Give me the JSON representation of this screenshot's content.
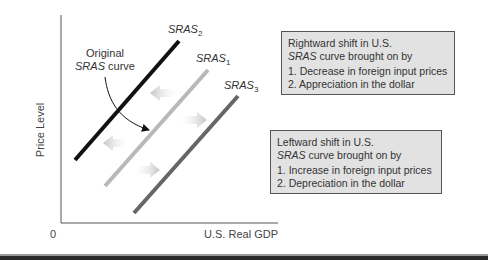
{
  "diagram": {
    "y_axis_label": "Price Level",
    "x_axis_label": "U.S. Real GDP",
    "origin_label": "0",
    "curves": [
      {
        "id": "sras2",
        "label_base": "SRAS",
        "label_sub": "2",
        "color": "#111111"
      },
      {
        "id": "sras1",
        "label_base": "SRAS",
        "label_sub": "1",
        "color": "#b8b8b8"
      },
      {
        "id": "sras3",
        "label_base": "SRAS",
        "label_sub": "3",
        "color": "#666666"
      }
    ],
    "annotation": {
      "line1": "Original",
      "line2_italic": "SRAS",
      "line2_rest": " curve"
    },
    "arrow_color": "#c8c8c8"
  },
  "boxes": {
    "rightward": {
      "title": "Rightward shift in U.S.",
      "subtitle_italic": "SRAS",
      "subtitle_rest": " curve brought on by",
      "items": [
        "1. Decrease in foreign input prices",
        "2. Appreciation in the dollar"
      ]
    },
    "leftward": {
      "title": "Leftward shift in U.S.",
      "subtitle_italic": "SRAS",
      "subtitle_rest": " curve brought on by",
      "items": [
        "1. Increase in foreign input prices",
        "2. Depreciation in the dollar"
      ]
    }
  }
}
